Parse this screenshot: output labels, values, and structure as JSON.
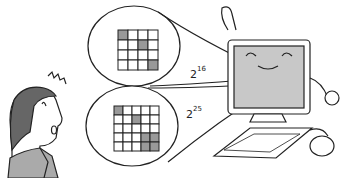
{
  "illustration": {
    "top_bubble": {
      "base": "2",
      "exponent": "16",
      "grid_size": 4,
      "shaded_cells": [
        [
          0,
          0
        ],
        [
          1,
          2
        ],
        [
          3,
          3
        ]
      ]
    },
    "bottom_bubble": {
      "base": "2",
      "exponent": "25",
      "grid_size": 5,
      "shaded_cells": [
        [
          0,
          0
        ],
        [
          1,
          2
        ],
        [
          3,
          3
        ],
        [
          3,
          4
        ],
        [
          4,
          3
        ],
        [
          4,
          4
        ]
      ]
    },
    "colors": {
      "line": "#222222",
      "shade": "#999999",
      "screen": "#c8c8c8",
      "hair": "#666666",
      "suit": "#aaaaaa"
    }
  }
}
